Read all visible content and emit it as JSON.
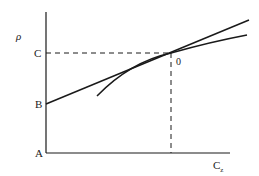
{
  "diagram": {
    "y_axis_label": "ρ",
    "x_axis_label": "C",
    "x_axis_subscript": "z",
    "point_labels": {
      "A": "A",
      "B": "B",
      "C": "C",
      "origin_point": "0"
    },
    "elements": [
      {
        "type": "axis",
        "name": "vertical-axis"
      },
      {
        "type": "axis",
        "name": "horizontal-axis"
      },
      {
        "type": "line",
        "name": "tangent-line",
        "from": "B",
        "through": "0"
      },
      {
        "type": "curve",
        "name": "curve",
        "through": "0"
      },
      {
        "type": "dashed",
        "name": "horizontal-guide",
        "from": "C",
        "to": "0"
      },
      {
        "type": "dashed",
        "name": "vertical-guide",
        "from": "0",
        "to": "x-axis"
      }
    ],
    "colors": {
      "stroke": "#1a1a1a",
      "background": "#ffffff"
    }
  }
}
